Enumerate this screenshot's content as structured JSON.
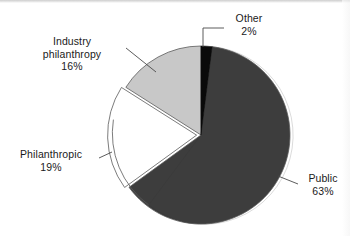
{
  "chart_data": {
    "type": "pie",
    "title": "",
    "subtitle": "",
    "xlabel": "",
    "ylabel": "",
    "legend_position": "none",
    "grid": false,
    "labels_outside": true,
    "leader_lines": true,
    "categories": [
      "Public",
      "Philanthropic",
      "Industry philanthropy",
      "Other"
    ],
    "values": [
      63,
      19,
      16,
      2
    ],
    "unit": "%",
    "slices": [
      {
        "name": "Public",
        "label": "Public",
        "value": 63,
        "value_text": "63%",
        "color": "#3d3d3d",
        "exploded": false,
        "start_angle_deg": 7.2,
        "end_angle_deg": 234.0
      },
      {
        "name": "Philanthropic",
        "label": "Philanthropic",
        "value": 19,
        "value_text": "19%",
        "color": "#ffffff",
        "exploded": true,
        "start_angle_deg": 234.0,
        "end_angle_deg": 302.4
      },
      {
        "name": "Industry philanthropy",
        "label": "Industry philanthropy",
        "label_line_1": "Industry",
        "label_line_2": "philanthropy",
        "value": 16,
        "value_text": "16%",
        "color": "#c8c8c8",
        "exploded": false,
        "start_angle_deg": 302.4,
        "end_angle_deg": 360.0
      },
      {
        "name": "Other",
        "label": "Other",
        "value": 2,
        "value_text": "2%",
        "color": "#0a0a0a",
        "exploded": false,
        "start_angle_deg": 0.0,
        "end_angle_deg": 7.2
      }
    ]
  },
  "colors": {
    "public": "#3d3d3d",
    "philanthropic": "#ffffff",
    "industry_philanthropy": "#c8c8c8",
    "other": "#0a0a0a",
    "outline": "#5a5a5a",
    "text": "#1a1a1a",
    "background": "#ffffff"
  },
  "labels": {
    "other": {
      "name": "Other",
      "pct": "2%"
    },
    "industry": {
      "line1": "Industry",
      "line2": "philanthropy",
      "pct": "16%"
    },
    "philanthropic": {
      "name": "Philanthropic",
      "pct": "19%"
    },
    "public": {
      "name": "Public",
      "pct": "63%"
    }
  }
}
